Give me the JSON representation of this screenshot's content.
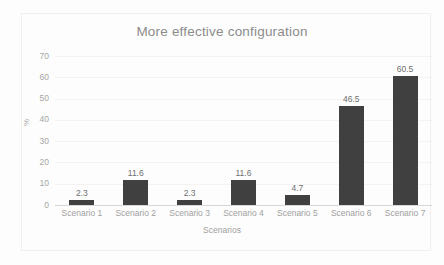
{
  "chart_data": {
    "type": "bar",
    "title": "More effective configuration",
    "xlabel": "Scenarios",
    "ylabel": "%",
    "categories": [
      "Scenario 1",
      "Scenario 2",
      "Scenario 3",
      "Scenario 4",
      "Scenario 5",
      "Scenario 6",
      "Scenario 7"
    ],
    "values": [
      2.3,
      11.6,
      2.3,
      11.6,
      4.7,
      46.5,
      60.5
    ],
    "data_labels": [
      "2.3",
      "11.6",
      "2.3",
      "11.6",
      "4.7",
      "46.5",
      "60.5"
    ],
    "ylim": [
      0,
      70
    ],
    "ytick_values": [
      0,
      10,
      20,
      30,
      40,
      50,
      60,
      70
    ],
    "ytick_labels": [
      "0",
      "10",
      "20",
      "30",
      "40",
      "50",
      "60",
      "70"
    ],
    "grid": "horizontal-only",
    "legend": "none",
    "bar_color": "#404040",
    "title_color": "#8c8c8c",
    "tick_color": "#a6a6a6",
    "gridline_color": "#f4f3f2",
    "background_color": "#fdfdfd"
  }
}
